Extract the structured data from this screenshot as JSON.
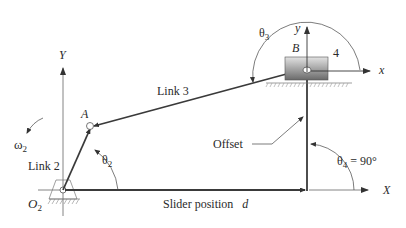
{
  "diagram": {
    "labels": {
      "global_y_axis": "Y",
      "global_x_axis": "X",
      "local_y_axis": "y",
      "local_x_axis": "x",
      "point_a": "A",
      "point_b": "B",
      "ground_pivot": "O",
      "ground_pivot_sub": "2",
      "link2": "Link 2",
      "link3": "Link 3",
      "slider_number": "4",
      "omega2": "ω",
      "omega2_sub": "2",
      "theta2": "θ",
      "theta2_sub": "2",
      "theta3": "θ",
      "theta3_sub": "3",
      "theta4": "θ",
      "theta4_sub": "4",
      "theta4_value": " = 90°",
      "offset": "Offset",
      "slider_position": "Slider position",
      "slider_position_var": "d"
    },
    "colors": {
      "link": "#3a3a3a",
      "axis": "#555555",
      "slider_top": "#d8d8d8",
      "slider_bottom": "#6e6e6e",
      "text": "#2a2a2a"
    }
  }
}
